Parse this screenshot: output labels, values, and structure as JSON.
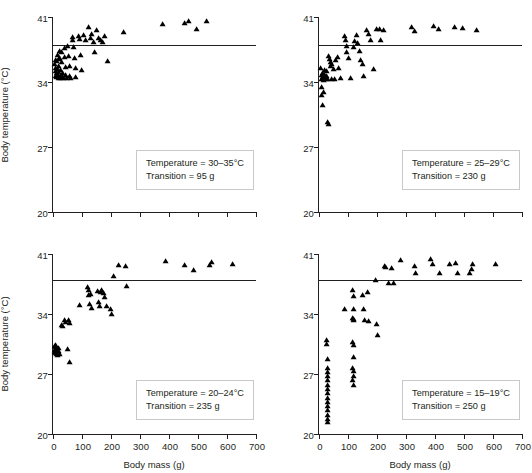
{
  "figure": {
    "layout": "2x2 grid of scatter plots"
  },
  "axes": {
    "xlabel": "Body mass (g)",
    "ylabel": "Body temperature (°C)",
    "xticks": [
      "0",
      "100",
      "200",
      "300",
      "400",
      "500",
      "600",
      "700"
    ],
    "yticks": [
      "20",
      "27",
      "34",
      "41"
    ],
    "xlim": [
      0,
      700
    ],
    "ylim": [
      20,
      41
    ]
  },
  "chart_data": [
    {
      "type": "scatter",
      "panel": "top-left",
      "title": "",
      "xlabel": "Body mass (g)",
      "ylabel": "Body temperature (°C)",
      "xlim": [
        0,
        700
      ],
      "ylim": [
        20,
        41
      ],
      "grid": false,
      "legend": "none",
      "annotation": {
        "temperature": "Temperature = 30–35°C",
        "transition": "Transition = 95 g"
      },
      "reference_line": {
        "orientation": "horizontal",
        "y": 38.0
      },
      "points": [
        [
          8,
          35.6
        ],
        [
          9,
          34.9
        ],
        [
          10,
          34.3
        ],
        [
          11,
          35.2
        ],
        [
          12,
          36.0
        ],
        [
          13,
          34.6
        ],
        [
          14,
          34.2
        ],
        [
          15,
          35.9
        ],
        [
          16,
          36.6
        ],
        [
          17,
          35.1
        ],
        [
          18,
          34.4
        ],
        [
          19,
          34.1
        ],
        [
          20,
          36.2
        ],
        [
          21,
          35.4
        ],
        [
          22,
          34.8
        ],
        [
          23,
          34.2
        ],
        [
          24,
          37.0
        ],
        [
          25,
          36.3
        ],
        [
          26,
          35.0
        ],
        [
          27,
          34.3
        ],
        [
          28,
          34.1
        ],
        [
          30,
          36.9
        ],
        [
          32,
          35.8
        ],
        [
          34,
          34.7
        ],
        [
          36,
          34.2
        ],
        [
          38,
          34.1
        ],
        [
          40,
          37.3
        ],
        [
          42,
          36.4
        ],
        [
          44,
          35.3
        ],
        [
          46,
          34.4
        ],
        [
          48,
          34.1
        ],
        [
          52,
          37.6
        ],
        [
          55,
          36.5
        ],
        [
          58,
          35.4
        ],
        [
          60,
          34.3
        ],
        [
          62,
          34.1
        ],
        [
          68,
          38.5
        ],
        [
          70,
          38.2
        ],
        [
          72,
          37.4
        ],
        [
          75,
          36.3
        ],
        [
          78,
          35.2
        ],
        [
          80,
          34.2
        ],
        [
          88,
          38.6
        ],
        [
          92,
          38.3
        ],
        [
          95,
          36.6
        ],
        [
          100,
          35.0
        ],
        [
          108,
          38.7
        ],
        [
          115,
          38.2
        ],
        [
          125,
          39.6
        ],
        [
          130,
          38.4
        ],
        [
          135,
          38.8
        ],
        [
          140,
          38.0
        ],
        [
          145,
          36.9
        ],
        [
          150,
          39.3
        ],
        [
          160,
          38.4
        ],
        [
          165,
          38.2
        ],
        [
          172,
          38.0
        ],
        [
          180,
          38.6
        ],
        [
          190,
          35.9
        ],
        [
          245,
          39.1
        ],
        [
          380,
          39.9
        ],
        [
          455,
          40.0
        ],
        [
          470,
          40.3
        ],
        [
          495,
          39.4
        ],
        [
          530,
          40.2
        ]
      ]
    },
    {
      "type": "scatter",
      "panel": "top-right",
      "title": "",
      "xlabel": "Body mass (g)",
      "ylabel": "Body temperature (°C)",
      "xlim": [
        0,
        700
      ],
      "ylim": [
        20,
        41
      ],
      "grid": false,
      "legend": "none",
      "annotation": {
        "temperature": "Temperature = 25–29°C",
        "transition": "Transition = 230 g"
      },
      "reference_line": {
        "orientation": "horizontal",
        "y": 38.0
      },
      "points": [
        [
          8,
          35.2
        ],
        [
          9,
          34.4
        ],
        [
          10,
          34.0
        ],
        [
          11,
          33.1
        ],
        [
          12,
          32.3
        ],
        [
          13,
          31.2
        ],
        [
          14,
          34.2
        ],
        [
          15,
          34.6
        ],
        [
          16,
          33.9
        ],
        [
          17,
          32.6
        ],
        [
          18,
          34.1
        ],
        [
          20,
          35.0
        ],
        [
          22,
          34.4
        ],
        [
          24,
          34.0
        ],
        [
          26,
          34.9
        ],
        [
          28,
          34.3
        ],
        [
          30,
          34.0
        ],
        [
          32,
          29.4
        ],
        [
          34,
          29.2
        ],
        [
          36,
          36.5
        ],
        [
          38,
          36.2
        ],
        [
          40,
          35.8
        ],
        [
          42,
          35.4
        ],
        [
          44,
          35.6
        ],
        [
          46,
          34.0
        ],
        [
          50,
          35.1
        ],
        [
          55,
          34.0
        ],
        [
          60,
          36.0
        ],
        [
          65,
          36.4
        ],
        [
          70,
          35.2
        ],
        [
          75,
          34.1
        ],
        [
          88,
          38.6
        ],
        [
          92,
          38.2
        ],
        [
          95,
          37.6
        ],
        [
          98,
          36.9
        ],
        [
          105,
          36.3
        ],
        [
          110,
          34.1
        ],
        [
          120,
          37.4
        ],
        [
          125,
          38.1
        ],
        [
          130,
          38.7
        ],
        [
          135,
          37.9
        ],
        [
          140,
          37.0
        ],
        [
          145,
          36.0
        ],
        [
          150,
          35.6
        ],
        [
          155,
          34.3
        ],
        [
          165,
          39.3
        ],
        [
          172,
          38.9
        ],
        [
          180,
          38.2
        ],
        [
          190,
          35.1
        ],
        [
          200,
          39.4
        ],
        [
          210,
          39.4
        ],
        [
          215,
          38.2
        ],
        [
          225,
          39.3
        ],
        [
          320,
          39.6
        ],
        [
          330,
          39.2
        ],
        [
          395,
          39.7
        ],
        [
          415,
          39.4
        ],
        [
          470,
          39.6
        ],
        [
          495,
          39.5
        ],
        [
          545,
          39.3
        ]
      ]
    },
    {
      "type": "scatter",
      "panel": "bottom-left",
      "title": "",
      "xlabel": "Body mass (g)",
      "ylabel": "Body temperature (°C)",
      "xlim": [
        0,
        700
      ],
      "ylim": [
        20,
        41
      ],
      "grid": false,
      "legend": "none",
      "annotation": {
        "temperature": "Temperature = 20–24°C",
        "transition": "Transition = 235 g"
      },
      "reference_line": {
        "orientation": "horizontal",
        "y": 38.0
      },
      "points": [
        [
          6,
          29.9
        ],
        [
          7,
          29.5
        ],
        [
          8,
          29.2
        ],
        [
          9,
          29.8
        ],
        [
          10,
          29.4
        ],
        [
          11,
          29.1
        ],
        [
          12,
          30.0
        ],
        [
          13,
          29.6
        ],
        [
          14,
          29.3
        ],
        [
          15,
          29.0
        ],
        [
          16,
          28.9
        ],
        [
          20,
          29.7
        ],
        [
          22,
          29.3
        ],
        [
          24,
          29.0
        ],
        [
          30,
          32.4
        ],
        [
          33,
          32.2
        ],
        [
          42,
          32.9
        ],
        [
          45,
          32.7
        ],
        [
          50,
          29.6
        ],
        [
          55,
          32.9
        ],
        [
          58,
          32.6
        ],
        [
          60,
          28.0
        ],
        [
          92,
          34.7
        ],
        [
          120,
          36.8
        ],
        [
          123,
          36.4
        ],
        [
          125,
          35.9
        ],
        [
          128,
          34.8
        ],
        [
          130,
          36.0
        ],
        [
          135,
          34.4
        ],
        [
          155,
          36.3
        ],
        [
          160,
          35.0
        ],
        [
          162,
          34.6
        ],
        [
          165,
          36.2
        ],
        [
          170,
          36.5
        ],
        [
          175,
          36.1
        ],
        [
          180,
          35.6
        ],
        [
          185,
          34.6
        ],
        [
          200,
          34.2
        ],
        [
          205,
          33.7
        ],
        [
          210,
          38.1
        ],
        [
          228,
          39.4
        ],
        [
          250,
          39.3
        ],
        [
          255,
          36.9
        ],
        [
          390,
          39.8
        ],
        [
          455,
          39.4
        ],
        [
          485,
          38.8
        ],
        [
          540,
          39.4
        ],
        [
          548,
          39.7
        ],
        [
          620,
          39.5
        ]
      ]
    },
    {
      "type": "scatter",
      "panel": "bottom-right",
      "title": "",
      "xlabel": "Body mass (g)",
      "ylabel": "Body temperature (°C)",
      "xlim": [
        0,
        700
      ],
      "ylim": [
        20,
        41
      ],
      "grid": false,
      "legend": "none",
      "annotation": {
        "temperature": "Temperature = 15–19°C",
        "transition": "Transition = 250 g"
      },
      "reference_line": {
        "orientation": "horizontal",
        "y": 38.0
      },
      "points": [
        [
          28,
          30.6
        ],
        [
          29,
          30.1
        ],
        [
          30,
          28.4
        ],
        [
          30,
          27.4
        ],
        [
          31,
          26.9
        ],
        [
          31,
          26.4
        ],
        [
          32,
          25.9
        ],
        [
          30,
          25.4
        ],
        [
          31,
          24.9
        ],
        [
          32,
          24.4
        ],
        [
          30,
          23.9
        ],
        [
          31,
          23.4
        ],
        [
          32,
          22.9
        ],
        [
          30,
          22.4
        ],
        [
          31,
          21.9
        ],
        [
          32,
          21.4
        ],
        [
          30,
          21.0
        ],
        [
          88,
          34.2
        ],
        [
          118,
          36.4
        ],
        [
          122,
          35.7
        ],
        [
          120,
          34.2
        ],
        [
          118,
          33.2
        ],
        [
          122,
          33.1
        ],
        [
          120,
          32.9
        ],
        [
          118,
          30.4
        ],
        [
          121,
          30.0
        ],
        [
          120,
          28.6
        ],
        [
          118,
          27.4
        ],
        [
          121,
          27.0
        ],
        [
          120,
          26.4
        ],
        [
          118,
          25.9
        ],
        [
          121,
          25.4
        ],
        [
          152,
          35.9
        ],
        [
          155,
          34.2
        ],
        [
          158,
          32.9
        ],
        [
          168,
          36.2
        ],
        [
          172,
          32.8
        ],
        [
          198,
          37.6
        ],
        [
          200,
          32.5
        ],
        [
          202,
          31.2
        ],
        [
          228,
          39.2
        ],
        [
          232,
          39.1
        ],
        [
          240,
          37.3
        ],
        [
          252,
          39.0
        ],
        [
          258,
          37.3
        ],
        [
          282,
          40.0
        ],
        [
          330,
          39.2
        ],
        [
          335,
          38.4
        ],
        [
          385,
          40.1
        ],
        [
          392,
          39.5
        ],
        [
          418,
          38.4
        ],
        [
          450,
          39.5
        ],
        [
          472,
          39.6
        ],
        [
          478,
          38.4
        ],
        [
          520,
          38.4
        ],
        [
          528,
          38.9
        ],
        [
          532,
          39.5
        ],
        [
          612,
          39.5
        ]
      ]
    }
  ]
}
